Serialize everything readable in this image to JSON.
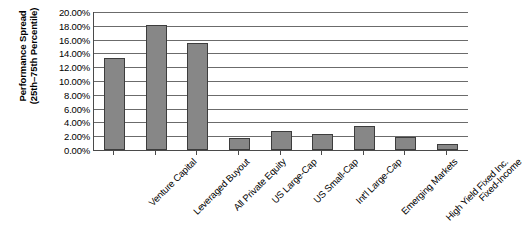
{
  "chart_data": {
    "type": "bar",
    "title": "",
    "xlabel": "",
    "ylabel": "Performance Spread (25th–75th Percentile)",
    "ylabel_line1": "Performance Spread",
    "ylabel_line2": "(25th–75th Percentile)",
    "ylim": [
      0,
      0.2
    ],
    "ytick_labels": [
      "20.00%",
      "18.00%",
      "16.00%",
      "14.00%",
      "12.00%",
      "10.00%",
      "8.00%",
      "6.00%",
      "4.00%",
      "2.00%",
      "0.00%"
    ],
    "ytick_values": [
      0.2,
      0.18,
      0.16,
      0.14,
      0.12,
      0.1,
      0.08,
      0.06,
      0.04,
      0.02,
      0.0
    ],
    "grid": true,
    "legend": "none",
    "categories": [
      "Venture Capital",
      "Leveraged Buyout",
      "All Private Equity",
      "US Large-Cap",
      "US Small-Cap",
      "Int'l Large-Cap",
      "Emerging Markets",
      "High Yield Fixed Inc.",
      "Fixed-Income"
    ],
    "values": [
      0.133,
      0.181,
      0.155,
      0.018,
      0.028,
      0.023,
      0.035,
      0.019,
      0.009
    ],
    "value_labels": [
      "13.30%",
      "18.10%",
      "15.50%",
      "1.80%",
      "2.80%",
      "2.30%",
      "3.50%",
      "1.90%",
      "0.90%"
    ],
    "bar_color": "#878787",
    "bar_edge_color": "#3d3d3d",
    "grid_color": "#6b6b6b",
    "axis_color": "#4a4a4a",
    "background_color": "#ffffff"
  }
}
